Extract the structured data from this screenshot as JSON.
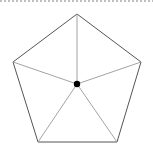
{
  "diagram": {
    "type": "pentagon-with-center-spokes",
    "border": {
      "style": "dotted",
      "color": "#aaaaaa"
    },
    "vertices": [
      [
        77,
        14
      ],
      [
        141,
        62
      ],
      [
        117,
        142
      ],
      [
        38,
        142
      ],
      [
        13,
        62
      ]
    ],
    "center": [
      77,
      84
    ],
    "outline_color": "#555555",
    "spoke_color": "#999999",
    "center_dot_color": "#000000"
  }
}
